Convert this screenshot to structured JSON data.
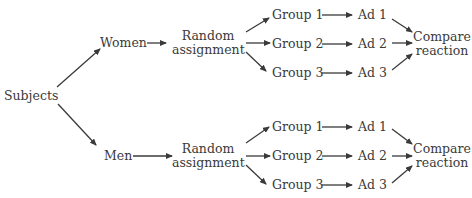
{
  "diagram": {
    "root": "Subjects",
    "branches": [
      {
        "name": "Women",
        "assignment": [
          "Random",
          "assignment"
        ],
        "groups": [
          {
            "group": "Group 1",
            "ad": "Ad 1"
          },
          {
            "group": "Group 2",
            "ad": "Ad 2"
          },
          {
            "group": "Group 3",
            "ad": "Ad 3"
          }
        ],
        "outcome": [
          "Compare",
          "reaction"
        ]
      },
      {
        "name": "Men",
        "assignment": [
          "Random",
          "assignment"
        ],
        "groups": [
          {
            "group": "Group 1",
            "ad": "Ad 1"
          },
          {
            "group": "Group 2",
            "ad": "Ad 2"
          },
          {
            "group": "Group 3",
            "ad": "Ad 3"
          }
        ],
        "outcome": [
          "Compare",
          "reaction"
        ]
      }
    ],
    "colors": {
      "text": "#3a3a3a",
      "arrow": "#3a3a3a",
      "background": "#ffffff"
    }
  }
}
